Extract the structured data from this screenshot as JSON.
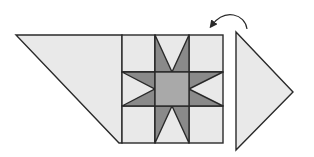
{
  "colors": {
    "background": "#e9e9e9",
    "star_point": "#8a8a8a",
    "center": "#a9a9a9",
    "outline": "#2a2a2a"
  },
  "pieces": {
    "left_setting_piece": "trapezoid",
    "block": "eight-point star (3x3 grid)",
    "right_setting_piece": "triangle"
  },
  "arrow": {
    "meaning": "rotate / flip piece",
    "direction": "counter-clockwise"
  }
}
